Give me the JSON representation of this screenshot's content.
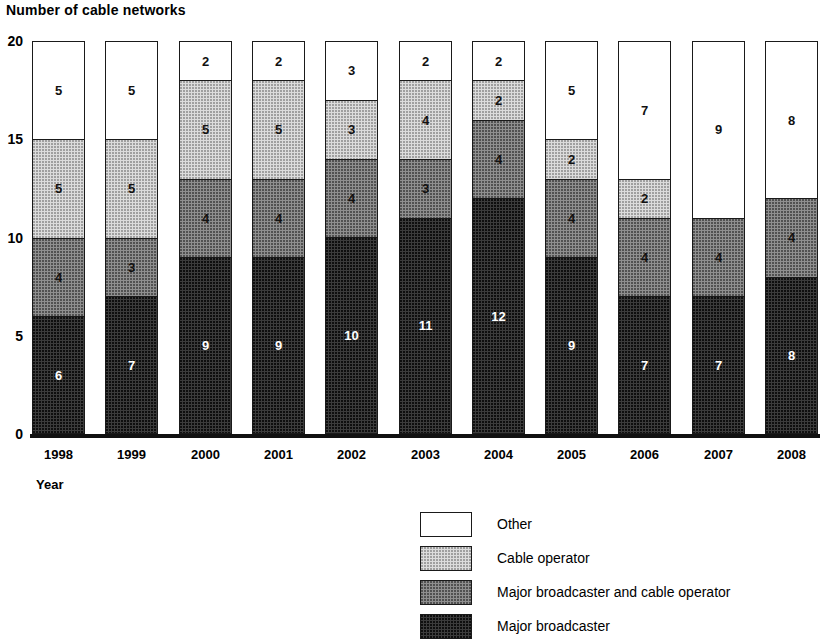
{
  "chart_title": "Number of cable networks",
  "axes": {
    "x_title": "Year",
    "y_ticks": [
      "0",
      "5",
      "10",
      "15",
      "20"
    ]
  },
  "legend": {
    "items": [
      {
        "label": "Other",
        "key": "other",
        "color": "#ffffff"
      },
      {
        "label": "Cable operator",
        "key": "cable_operator",
        "color": "#dcdcdc"
      },
      {
        "label": "Major broadcaster and cable operator",
        "key": "major_and_cable",
        "color": "#8f8f8f"
      },
      {
        "label": "Major broadcaster",
        "key": "major_broadcaster",
        "color": "#3c3c3c"
      }
    ]
  },
  "chart_data": {
    "type": "bar",
    "subtype": "stacked",
    "title": "Number of cable networks",
    "xlabel": "Year",
    "ylabel": "Number of cable networks",
    "ylim": [
      0,
      20
    ],
    "yticks": [
      0,
      5,
      10,
      15,
      20
    ],
    "grid": false,
    "legend_position": "bottom-center",
    "categories": [
      "1998",
      "1999",
      "2000",
      "2001",
      "2002",
      "2003",
      "2004",
      "2005",
      "2006",
      "2007",
      "2008"
    ],
    "series": [
      {
        "name": "Major broadcaster",
        "color": "#3c3c3c",
        "values": [
          6,
          7,
          9,
          9,
          10,
          11,
          12,
          9,
          7,
          7,
          8
        ]
      },
      {
        "name": "Major broadcaster and cable operator",
        "color": "#8f8f8f",
        "values": [
          4,
          3,
          4,
          4,
          4,
          3,
          4,
          4,
          4,
          4,
          4
        ]
      },
      {
        "name": "Cable operator",
        "color": "#dcdcdc",
        "values": [
          5,
          5,
          5,
          5,
          3,
          4,
          2,
          2,
          2,
          0,
          0
        ]
      },
      {
        "name": "Other",
        "color": "#ffffff",
        "values": [
          5,
          5,
          2,
          2,
          3,
          2,
          2,
          5,
          7,
          9,
          8
        ]
      }
    ],
    "totals": [
      20,
      20,
      20,
      20,
      20,
      20,
      20,
      20,
      20,
      20,
      20
    ]
  }
}
